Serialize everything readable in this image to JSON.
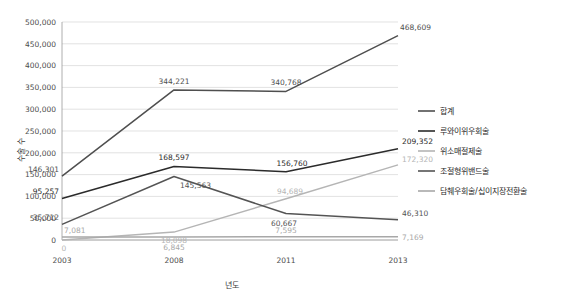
{
  "chart_data": {
    "type": "line",
    "title": "",
    "xlabel": "년도",
    "ylabel": "수술 수",
    "categories": [
      "2003",
      "2008",
      "2011",
      "2013"
    ],
    "x": [
      2003,
      2008,
      2011,
      2013
    ],
    "ylim": [
      0,
      500000
    ],
    "ytick_labels": [
      "0",
      "50,000",
      "100,000",
      "150,000",
      "200,000",
      "250,000",
      "300,000",
      "350,000",
      "400,000",
      "450,000",
      "500,000"
    ],
    "ytick_values": [
      0,
      50000,
      100000,
      150000,
      200000,
      250000,
      300000,
      350000,
      400000,
      450000,
      500000
    ],
    "grid": true,
    "legend_position": "right",
    "series": [
      {
        "name": "합계",
        "color": "#4f4f4f",
        "values": [
          146301,
          344221,
          340768,
          468609
        ],
        "labels": [
          "146,301",
          "344,221",
          "340,768",
          "468,609"
        ]
      },
      {
        "name": "루와이위우회술",
        "color": "#2b2b2b",
        "values": [
          95257,
          168597,
          156760,
          209352
        ],
        "labels": [
          "95,257",
          "168,597",
          "156,760",
          "209,352"
        ]
      },
      {
        "name": "위소매절제술",
        "color": "#b5b5b5",
        "values": [
          0,
          18098,
          94689,
          172320
        ],
        "labels": [
          "0",
          "18,098",
          "94,689",
          "172,320"
        ]
      },
      {
        "name": "조절형위밴드술",
        "color": "#545454",
        "values": [
          35712,
          145563,
          60667,
          46310
        ],
        "labels": [
          "35,712",
          "145,563",
          "60,667",
          "46,310"
        ]
      },
      {
        "name": "담췌우회술/십이지장전환술",
        "color": "#a8a8a8",
        "values": [
          7081,
          6845,
          7595,
          7169
        ],
        "labels": [
          "7,081",
          "6,845",
          "7,595",
          "7,169"
        ]
      }
    ]
  }
}
